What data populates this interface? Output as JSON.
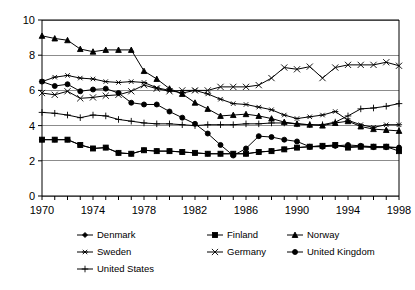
{
  "chart_data": {
    "type": "line",
    "title": "",
    "subtitle": "",
    "xlabel": "",
    "ylabel": "",
    "xlim": [
      1970,
      1998
    ],
    "ylim": [
      0,
      10
    ],
    "yticks": [
      "0",
      "2",
      "4",
      "6",
      "8",
      "10"
    ],
    "ytick_values": [
      0,
      2,
      4,
      6,
      8,
      10
    ],
    "grid": "horizontal",
    "legend_position": "bottom",
    "x": [
      1970,
      1971,
      1972,
      1973,
      1974,
      1975,
      1976,
      1977,
      1978,
      1979,
      1980,
      1981,
      1982,
      1983,
      1984,
      1985,
      1986,
      1987,
      1988,
      1989,
      1990,
      1991,
      1992,
      1993,
      1994,
      1995,
      1996,
      1997,
      1998
    ],
    "xtick_labels": [
      "1970",
      "1974",
      "1978",
      "1982",
      "1986",
      "1990",
      "1994",
      "1998"
    ],
    "xtick_values": [
      1970,
      1974,
      1978,
      1982,
      1986,
      1990,
      1994,
      1998
    ],
    "series": [
      {
        "name": "Denmark",
        "marker": "diamond",
        "values": [
          3.2,
          3.2,
          3.2,
          2.9,
          2.7,
          2.75,
          2.45,
          2.4,
          2.6,
          2.55,
          2.55,
          2.5,
          2.45,
          2.4,
          2.4,
          2.4,
          2.4,
          2.5,
          2.55,
          2.65,
          2.75,
          2.8,
          2.85,
          2.85,
          2.8,
          2.8,
          2.75,
          2.75,
          2.75
        ]
      },
      {
        "name": "Finland",
        "marker": "square",
        "values": [
          3.2,
          3.2,
          3.2,
          2.9,
          2.7,
          2.75,
          2.45,
          2.4,
          2.6,
          2.55,
          2.55,
          2.5,
          2.45,
          2.4,
          2.4,
          2.4,
          2.4,
          2.5,
          2.55,
          2.65,
          2.75,
          2.8,
          2.85,
          2.9,
          2.75,
          2.8,
          2.8,
          2.8,
          2.55
        ]
      },
      {
        "name": "Norway",
        "marker": "triangle",
        "values": [
          9.1,
          8.95,
          8.85,
          8.35,
          8.2,
          8.3,
          8.3,
          8.3,
          7.1,
          6.65,
          6.1,
          5.8,
          5.3,
          4.95,
          4.55,
          4.6,
          4.65,
          4.55,
          4.4,
          4.2,
          4.1,
          4.05,
          4.0,
          4.15,
          4.25,
          3.95,
          3.8,
          3.75,
          3.7
        ]
      },
      {
        "name": "Sweden",
        "marker": "asterisk",
        "values": [
          6.5,
          6.75,
          6.85,
          6.7,
          6.65,
          6.5,
          6.45,
          6.5,
          6.45,
          6.15,
          6.0,
          5.85,
          6.0,
          5.8,
          5.5,
          5.25,
          5.2,
          5.05,
          4.9,
          4.6,
          4.4,
          4.5,
          4.6,
          4.8,
          4.3,
          4.05,
          3.9,
          4.05,
          4.05
        ]
      },
      {
        "name": "Germany",
        "marker": "x",
        "values": [
          5.85,
          5.75,
          5.95,
          5.55,
          5.6,
          5.7,
          5.75,
          5.95,
          6.3,
          6.1,
          5.95,
          6.0,
          6.0,
          6.0,
          6.2,
          6.2,
          6.2,
          6.3,
          6.7,
          7.3,
          7.2,
          7.35,
          6.7,
          7.3,
          7.45,
          7.45,
          7.45,
          7.6,
          7.4
        ]
      },
      {
        "name": "United Kingdom",
        "marker": "circle",
        "values": [
          6.5,
          6.25,
          6.35,
          5.95,
          6.05,
          6.1,
          5.85,
          5.3,
          5.2,
          5.2,
          4.8,
          4.45,
          4.1,
          3.55,
          2.9,
          2.3,
          2.7,
          3.4,
          3.35,
          3.2,
          3.1,
          2.8,
          2.8,
          2.85,
          2.9,
          2.85,
          2.8,
          2.8,
          2.75
        ]
      },
      {
        "name": "United States",
        "marker": "plus",
        "values": [
          4.75,
          4.7,
          4.6,
          4.45,
          4.6,
          4.55,
          4.35,
          4.25,
          4.15,
          4.1,
          4.1,
          4.05,
          4.0,
          4.05,
          4.05,
          4.05,
          4.1,
          4.1,
          4.15,
          4.15,
          4.1,
          4.05,
          4.05,
          4.2,
          4.55,
          4.95,
          5.0,
          5.1,
          5.25
        ]
      }
    ]
  },
  "legend": {
    "items": [
      {
        "label": "Denmark",
        "marker": "diamond"
      },
      {
        "label": "Finland",
        "marker": "square"
      },
      {
        "label": "Norway",
        "marker": "triangle"
      },
      {
        "label": "Sweden",
        "marker": "asterisk"
      },
      {
        "label": "Germany",
        "marker": "x"
      },
      {
        "label": "United Kingdom",
        "marker": "circle"
      },
      {
        "label": "United States",
        "marker": "plus"
      }
    ]
  }
}
